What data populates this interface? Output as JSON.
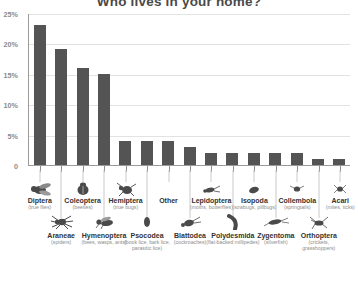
{
  "chart_data": {
    "type": "bar",
    "title": "Who lives in your home?",
    "xlabel": "",
    "ylabel": "",
    "ylim": [
      0,
      25
    ],
    "grid": true,
    "legend": false,
    "ytick_labels": [
      "0",
      "5%",
      "10%",
      "15%",
      "20%",
      "25%"
    ],
    "ytick_values": [
      0,
      5,
      10,
      15,
      20,
      25
    ],
    "categories": [
      "Diptera",
      "Araneae",
      "Coleoptera",
      "Hymenoptera",
      "Hemiptera",
      "Psocodea",
      "Other",
      "Blattodea",
      "Lepidoptera",
      "Polydesmida",
      "Isopoda",
      "Zygentoma",
      "Collembola",
      "Orthoptera",
      "Acari"
    ],
    "values": [
      23,
      19,
      16,
      15,
      4,
      4,
      4,
      3,
      2,
      2,
      2,
      2,
      2,
      1,
      1
    ],
    "bars": [
      {
        "name": "Diptera",
        "sub": "(true flies)",
        "value": 23,
        "row": "A",
        "icon": "fly-icon"
      },
      {
        "name": "Araneae",
        "sub": "(spiders)",
        "value": 19,
        "row": "B",
        "icon": "spider-icon"
      },
      {
        "name": "Coleoptera",
        "sub": "(beetles)",
        "value": 16,
        "row": "A",
        "icon": "beetle-icon"
      },
      {
        "name": "Hymenoptera",
        "sub": "(bees, wasps, ants)",
        "value": 15,
        "row": "B",
        "icon": "wasp-icon"
      },
      {
        "name": "Hemiptera",
        "sub": "(true bugs)",
        "value": 4,
        "row": "A",
        "icon": "true-bug-icon"
      },
      {
        "name": "Psocodea",
        "sub": "(book lice, bark lice, parasitic lice)",
        "value": 4,
        "row": "B",
        "icon": "booklouse-icon"
      },
      {
        "name": "Other",
        "sub": "",
        "value": 4,
        "row": "A",
        "icon": "none-icon"
      },
      {
        "name": "Blattodea",
        "sub": "(cockroaches)",
        "value": 3,
        "row": "B",
        "icon": "cockroach-icon"
      },
      {
        "name": "Lepidoptera",
        "sub": "(moths, butterflies)",
        "value": 2,
        "row": "A",
        "icon": "moth-icon"
      },
      {
        "name": "Polydesmida",
        "sub": "(flat-backed millipedes)",
        "value": 2,
        "row": "B",
        "icon": "millipede-icon"
      },
      {
        "name": "Isopoda",
        "sub": "(sowbugs, pillbugs)",
        "value": 2,
        "row": "A",
        "icon": "sowbug-icon"
      },
      {
        "name": "Zygentoma",
        "sub": "(silverfish)",
        "value": 2,
        "row": "B",
        "icon": "silverfish-icon"
      },
      {
        "name": "Collembola",
        "sub": "(springtails)",
        "value": 2,
        "row": "A",
        "icon": "springtail-icon"
      },
      {
        "name": "Orthoptera",
        "sub": "(crickets, grasshoppers)",
        "value": 1,
        "row": "B",
        "icon": "cricket-icon"
      },
      {
        "name": "Acari",
        "sub": "(mites, ticks)",
        "value": 1,
        "row": "A",
        "icon": "mite-icon"
      }
    ],
    "colors": {
      "bar": "#545454",
      "grid": "#e2e2e2",
      "axis": "#9a9a9a",
      "title": "#4a4a4a",
      "label": "#333333",
      "sublabel": "#8d8d8d",
      "tick": "#8a8a8a",
      "background": "#ffffff"
    }
  }
}
